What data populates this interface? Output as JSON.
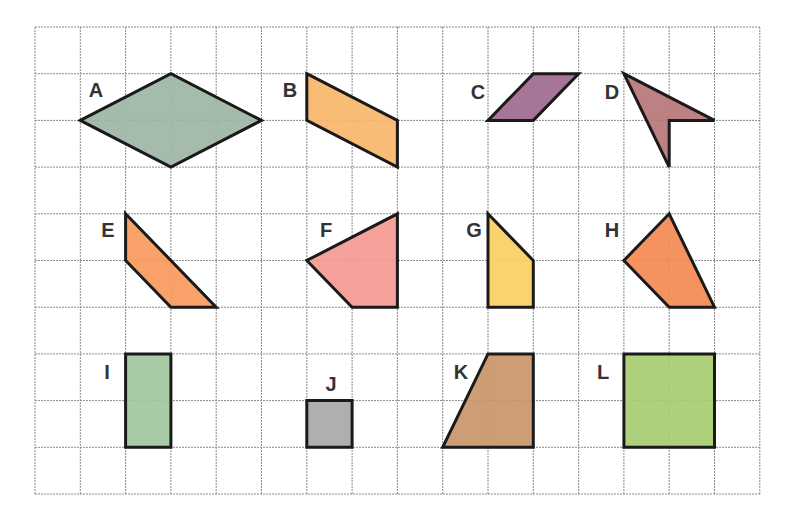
{
  "grid": {
    "origin_x": 35,
    "origin_y": 27,
    "cell_w": 45.3,
    "cell_h": 46.7,
    "cols": 16,
    "rows": 10,
    "line_color": "#8a8a8a"
  },
  "shapes": [
    {
      "label": "A",
      "name": "rhombus",
      "color": "#9db5a5",
      "points": [
        [
          1,
          2
        ],
        [
          3,
          1
        ],
        [
          5,
          2
        ],
        [
          3,
          3
        ]
      ],
      "label_pos": [
        96,
        97
      ]
    },
    {
      "label": "B",
      "name": "parallelogram",
      "color": "#f8b66b",
      "points": [
        [
          6,
          1
        ],
        [
          8,
          2
        ],
        [
          8,
          3
        ],
        [
          6,
          2
        ]
      ],
      "label_pos": [
        290,
        97
      ]
    },
    {
      "label": "C",
      "name": "parallelogram",
      "color": "#a0698f",
      "points": [
        [
          11,
          1
        ],
        [
          12,
          1
        ],
        [
          11,
          2
        ],
        [
          10,
          2
        ]
      ],
      "label_pos": [
        478,
        99
      ]
    },
    {
      "label": "D",
      "name": "concave-quadrilateral",
      "color": "#b87676",
      "points": [
        [
          13,
          1
        ],
        [
          15,
          2
        ],
        [
          14,
          2
        ],
        [
          14,
          3
        ]
      ],
      "label_pos": [
        612,
        99
      ]
    },
    {
      "label": "E",
      "name": "trapezoid",
      "color": "#f79a5c",
      "points": [
        [
          2,
          4
        ],
        [
          4,
          6
        ],
        [
          3,
          6
        ],
        [
          2,
          5
        ]
      ],
      "label_pos": [
        108,
        237
      ]
    },
    {
      "label": "F",
      "name": "quadrilateral",
      "color": "#f59a92",
      "points": [
        [
          8,
          4
        ],
        [
          8,
          6
        ],
        [
          7,
          6
        ],
        [
          6,
          5
        ]
      ],
      "label_pos": [
        326,
        237
      ]
    },
    {
      "label": "G",
      "name": "right-trapezoid",
      "color": "#f9cf5e",
      "points": [
        [
          10,
          4
        ],
        [
          11,
          5
        ],
        [
          11,
          6
        ],
        [
          10,
          6
        ]
      ],
      "label_pos": [
        474,
        237
      ]
    },
    {
      "label": "H",
      "name": "quadrilateral",
      "color": "#f48a52",
      "points": [
        [
          14,
          4
        ],
        [
          15,
          6
        ],
        [
          14,
          6
        ],
        [
          13,
          5
        ]
      ],
      "label_pos": [
        612,
        237
      ]
    },
    {
      "label": "I",
      "name": "rectangle",
      "color": "#9fc5a0",
      "points": [
        [
          2,
          7
        ],
        [
          3,
          7
        ],
        [
          3,
          9
        ],
        [
          2,
          9
        ]
      ],
      "label_pos": [
        107,
        379
      ]
    },
    {
      "label": "J",
      "name": "square",
      "color": "#a8a8a8",
      "points": [
        [
          6,
          8
        ],
        [
          7,
          8
        ],
        [
          7,
          9
        ],
        [
          6,
          9
        ]
      ],
      "label_pos": [
        331,
        391
      ]
    },
    {
      "label": "K",
      "name": "trapezoid",
      "color": "#c9966a",
      "points": [
        [
          10,
          7
        ],
        [
          11,
          7
        ],
        [
          11,
          9
        ],
        [
          9,
          9
        ]
      ],
      "label_pos": [
        461,
        379
      ]
    },
    {
      "label": "L",
      "name": "square",
      "color": "#a8cc70",
      "points": [
        [
          13,
          7
        ],
        [
          15,
          7
        ],
        [
          15,
          9
        ],
        [
          13,
          9
        ]
      ],
      "label_pos": [
        603,
        379
      ]
    }
  ]
}
